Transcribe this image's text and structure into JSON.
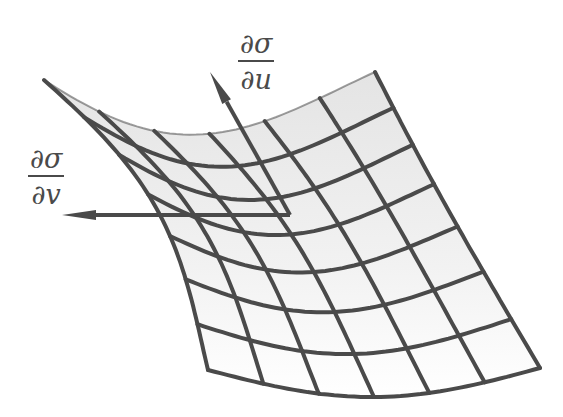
{
  "figure": {
    "colors": {
      "line": "#4a4a4a",
      "background": "#ffffff",
      "shade": "#e6e6e6"
    },
    "labels": {
      "du": {
        "numerator": "∂σ",
        "denominator": "∂u"
      },
      "dv": {
        "numerator": "∂σ",
        "denominator": "∂v"
      }
    },
    "surface": {
      "corners": {
        "top_left": [
          44,
          80
        ],
        "top_right": [
          375,
          72
        ],
        "bottom_right": [
          540,
          368
        ],
        "bottom_left": [
          208,
          370
        ]
      },
      "u_lines": 8,
      "v_lines": 7
    },
    "vectors": [
      {
        "name": "partial-sigma-partial-u",
        "from": [
          290,
          215
        ],
        "to": [
          210,
          72
        ]
      },
      {
        "name": "partial-sigma-partial-v",
        "from": [
          290,
          215
        ],
        "to": [
          62,
          215
        ]
      }
    ]
  }
}
